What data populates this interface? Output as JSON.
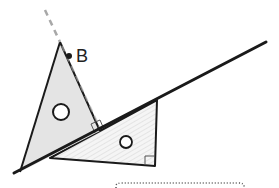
{
  "diagram": {
    "point_label": "B",
    "colors": {
      "stroke": "#1a1a1a",
      "triangle_fill": "#e4e4e4",
      "hatch_fill": "#f3f3f3",
      "hatch_line": "#d6d6d6",
      "dashed": "#a8a8a8",
      "dotted": "#555555"
    },
    "shapes": {
      "long_line": {
        "x1": 14,
        "y1": 173,
        "x2": 266,
        "y2": 42
      },
      "triangle_gray": {
        "points": "60,42 20,172 100,131"
      },
      "triangle_hatched": {
        "points": "50,158 157,100 155,166"
      },
      "dashed_extension": {
        "x1": 45,
        "y1": 10,
        "x2": 100,
        "y2": 128
      },
      "point_b": {
        "cx": 69,
        "cy": 56
      },
      "circle_1": {
        "cx": 61,
        "cy": 112,
        "r": 8
      },
      "circle_2": {
        "cx": 126,
        "cy": 142,
        "r": 6
      },
      "right_angle_1": "Perpendicular at triangle-line junction",
      "right_angle_2": "Right angle at hatched triangle lower-right corner"
    }
  }
}
